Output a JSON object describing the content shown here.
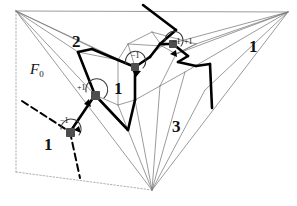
{
  "figure": {
    "background_color": "#ffffff",
    "width": 297,
    "height": 206,
    "colors": {
      "thin_mesh": "#7a7a7a",
      "bold_path": "#000000",
      "dashed_line": "#000000",
      "dotted_frame": "#9a9a9a",
      "vertex_marker": "#4d4d4d",
      "label_text": "#111111"
    }
  },
  "region_labels": [
    {
      "id": "region-2-upper-left",
      "text": "2",
      "x": 72,
      "y": 33
    },
    {
      "id": "region-1-center",
      "text": "1",
      "x": 114,
      "y": 80
    },
    {
      "id": "region-3-lower-right",
      "text": "3",
      "x": 172,
      "y": 118
    },
    {
      "id": "region-1-right",
      "text": "1",
      "x": 249,
      "y": 38
    },
    {
      "id": "region-1-lower-left",
      "text": "1",
      "x": 44,
      "y": 136
    }
  ],
  "index_labels": [
    {
      "id": "index-center",
      "text": "−1",
      "x": 131,
      "y": 52
    },
    {
      "id": "index-left",
      "text": "+1",
      "x": 77,
      "y": 84
    },
    {
      "id": "index-bottomleft",
      "text": "−1",
      "x": 60,
      "y": 117
    },
    {
      "id": "index-topright-a",
      "text": "−1",
      "x": 172,
      "y": 38
    },
    {
      "id": "index-topright-b",
      "text": "+1",
      "x": 184,
      "y": 38
    }
  ],
  "face_label": {
    "id": "face-F0",
    "base": "F",
    "subscript": "0",
    "x": 30,
    "y": 62
  },
  "vertex_markers": [
    {
      "id": "marker-center",
      "x": 135,
      "y": 67,
      "index": "−1"
    },
    {
      "id": "marker-left",
      "x": 95,
      "y": 95,
      "index": "+1"
    },
    {
      "id": "marker-bottomleft",
      "x": 70,
      "y": 132,
      "index": "−1"
    },
    {
      "id": "marker-topright",
      "x": 173,
      "y": 44,
      "index": "+1"
    }
  ],
  "geometry": {
    "outer_vertices": {
      "top_left": [
        16,
        11
      ],
      "top_right": [
        288,
        12
      ],
      "bottom": [
        152,
        190
      ]
    },
    "dotted_frame": [
      [
        16,
        11
      ],
      [
        16,
        172
      ],
      [
        152,
        190
      ]
    ],
    "description": "Triangulated polyhedral surface with bold vector-field trajectory and circular arc arrows at four singular points"
  }
}
